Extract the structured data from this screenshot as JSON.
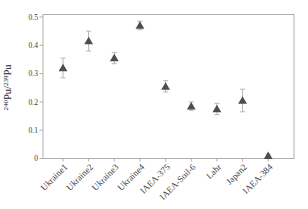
{
  "figure": {
    "width": 308,
    "height": 209,
    "background": "#ffffff",
    "frame_color": "#b0b0b0",
    "marker_color": "#4d4d4d",
    "errorbar_color": "#b5b5b5",
    "text_color": "#3a3a3a"
  },
  "chart_data": {
    "type": "scatter",
    "title": "",
    "xlabel": "",
    "ylabel": "240Pu/239Pu",
    "ylabel_parts": [
      {
        "text": "240",
        "sup": true
      },
      {
        "text": "Pu/",
        "sup": false
      },
      {
        "text": "239",
        "sup": true
      },
      {
        "text": "Pu",
        "sup": false
      }
    ],
    "ylim": [
      0,
      0.51
    ],
    "yticks": [
      0,
      0.1,
      0.2,
      0.3,
      0.4,
      0.5
    ],
    "ytick_labels": [
      "0",
      "0.1",
      "0.2",
      "0.3",
      "0.4",
      "0.5"
    ],
    "grid": false,
    "legend": "none",
    "categories": [
      "Ukraine1",
      "Ukraine2",
      "Ukraine3",
      "Ukraine4",
      "IAEA-375",
      "IAEA-Soil-6",
      "Lahr",
      "Japan2",
      "IAEA-384"
    ],
    "series": [
      {
        "name": "240Pu/239Pu atom ratio",
        "marker": "triangle-up",
        "values": [
          0.32,
          0.415,
          0.355,
          0.47,
          0.255,
          0.185,
          0.175,
          0.205,
          0.01
        ],
        "errors": [
          0.035,
          0.035,
          0.02,
          0.015,
          0.02,
          0.015,
          0.02,
          0.04,
          0.005
        ]
      }
    ]
  }
}
